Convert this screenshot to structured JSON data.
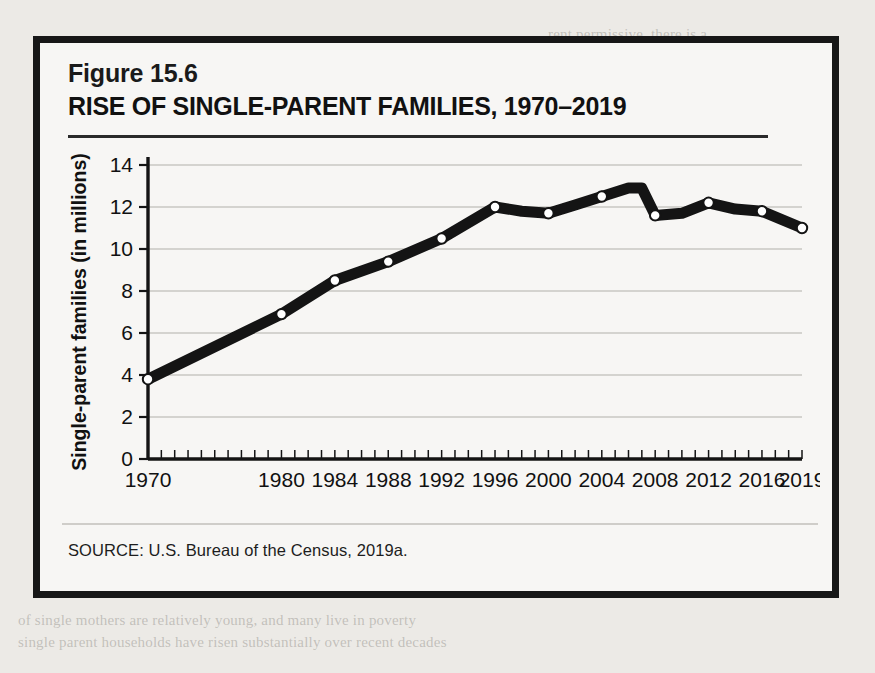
{
  "figure": {
    "number_label": "Figure 15.6",
    "title": "RISE OF SINGLE-PARENT FAMILIES, 1970–2019",
    "source": "SOURCE: U.S. Bureau of the Census, 2019a."
  },
  "colors": {
    "page_background": "#eceae6",
    "figure_background": "#f7f6f4",
    "frame_border": "#171717",
    "line": "#141414",
    "marker_fill": "#ffffff",
    "gridline": "#c9c7c3",
    "axis": "#141414",
    "text": "#111111"
  },
  "chart_data": {
    "type": "line",
    "title": "RISE OF SINGLE-PARENT FAMILIES, 1970–2019",
    "xlabel": "",
    "ylabel": "Single-parent families (in millions)",
    "xlim": [
      1970,
      2019
    ],
    "ylim": [
      0,
      14
    ],
    "yticks": [
      0,
      2,
      4,
      6,
      8,
      10,
      12,
      14
    ],
    "ytick_labels": [
      "0",
      "2",
      "4",
      "6",
      "8",
      "10",
      "12",
      "14"
    ],
    "xtick_labels": [
      "1970",
      "1980",
      "1984",
      "1988",
      "1992",
      "1996",
      "2000",
      "2004",
      "2008",
      "2012",
      "2016",
      "2019"
    ],
    "xticks": [
      1970,
      1980,
      1984,
      1988,
      1992,
      1996,
      2000,
      2004,
      2008,
      2012,
      2016,
      2019
    ],
    "grid": true,
    "grid_axis": "y",
    "legend": false,
    "marker": "circle-open",
    "x": [
      1970,
      1980,
      1984,
      1988,
      1992,
      1996,
      1998,
      2000,
      2002,
      2004,
      2006,
      2007,
      2008,
      2010,
      2012,
      2014,
      2016,
      2019
    ],
    "values": [
      3.8,
      6.9,
      8.5,
      9.4,
      10.5,
      12.0,
      11.8,
      11.7,
      12.1,
      12.5,
      12.9,
      12.9,
      11.6,
      11.7,
      12.2,
      11.9,
      11.8,
      11.0
    ],
    "series": [
      {
        "name": "Single-parent families",
        "values": [
          3.8,
          6.9,
          8.5,
          9.4,
          10.5,
          12.0,
          11.8,
          11.7,
          12.1,
          12.5,
          12.9,
          12.9,
          11.6,
          11.7,
          12.2,
          11.9,
          11.8,
          11.0
        ]
      }
    ],
    "marker_points": [
      {
        "x": 1970,
        "y": 3.8
      },
      {
        "x": 1980,
        "y": 6.9
      },
      {
        "x": 1984,
        "y": 8.5
      },
      {
        "x": 1988,
        "y": 9.4
      },
      {
        "x": 1992,
        "y": 10.5
      },
      {
        "x": 1996,
        "y": 12.0
      },
      {
        "x": 2000,
        "y": 11.7
      },
      {
        "x": 2004,
        "y": 12.5
      },
      {
        "x": 2008,
        "y": 11.6
      },
      {
        "x": 2012,
        "y": 12.2
      },
      {
        "x": 2016,
        "y": 11.8
      },
      {
        "x": 2019,
        "y": 11.0
      }
    ]
  },
  "bleed_text": {
    "top_right": [
      "extremely permissive, there is a",
      "children's mental health. If parents at extremely high conflict",
      "to stay together for the sake of the children, it would",
      "be better for the children's mental health to separate",
      "and try low levels of parental conflict before divorcing"
    ],
    "mid_right": [
      "Raising Children Alone",
      "The proportion of men and women who do not have children increased steadily",
      "the 1970s and 1990s, yet has recently declined in part because the recent increase",
      "of families are to some more effective means to control the",
      "number of children they will have and when to have children, and more couples",
      "are choosing to have fewer children, later than ever, and more",
      "increased from 10 percent in 1976 to 19 percent in 2018 to 20 percent in 2019.",
      "and decreased"
    ],
    "bottom_right": [
      "As shown in Figure 15.6 the number of single-parent families has",
      "increased markedly since 1970, although the number has",
      "stayed about 1 in 3 U.S. children respectively. Although most single parents are still",
      "mothers, there is a greater diversity in the kinds of single-parent households",
      "the number of single-parent families has remained fairly stable"
    ]
  }
}
